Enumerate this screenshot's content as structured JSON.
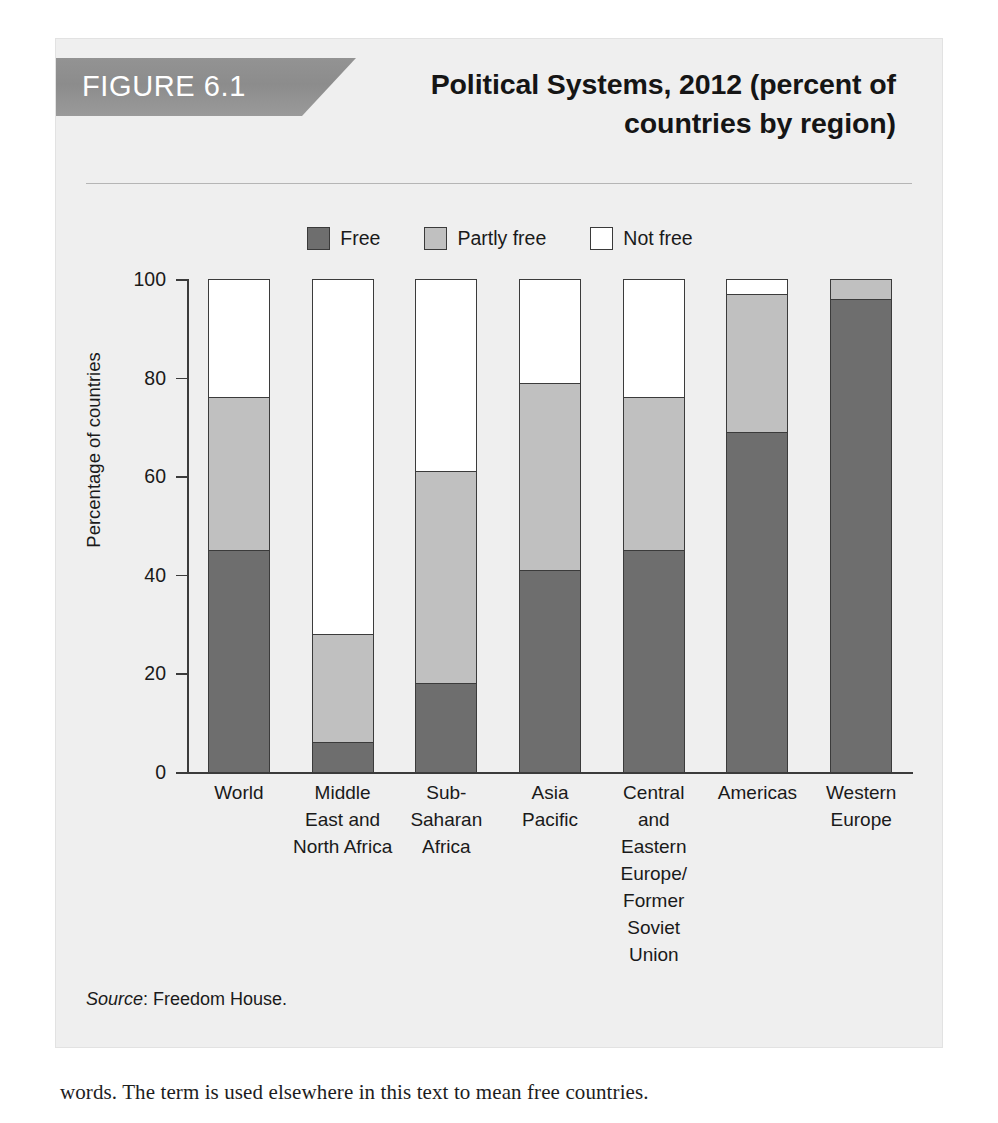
{
  "figure": {
    "number_label": "FIGURE 6.1",
    "title_line1": "Political Systems, 2012 (percent of",
    "title_line2": "countries by region)",
    "source_prefix": "Source",
    "source_text": ": Freedom House."
  },
  "colors": {
    "free": "#6e6e6e",
    "partly_free": "#c0c0c0",
    "not_free": "#ffffff",
    "outline": "#3b3b3b",
    "card_background": "#efefef",
    "tab_background": "#8f8f8f",
    "tab_text": "#ffffff",
    "text": "#1a1a1a"
  },
  "page": {
    "body_caption": "words. The term is used elsewhere in this text to mean free countries."
  },
  "chart_data": {
    "type": "bar",
    "stacked": true,
    "normalized_percent": true,
    "title": "Political Systems, 2012 (percent of countries by region)",
    "xlabel": "",
    "ylabel": "Percentage of countries",
    "ylim": [
      0,
      100
    ],
    "yticks": [
      0,
      20,
      40,
      60,
      80,
      100
    ],
    "ytick_labels": [
      "0",
      "20",
      "40",
      "60",
      "80",
      "100"
    ],
    "grid": false,
    "legend_position": "top-center",
    "categories": [
      "World",
      "Middle East and North Africa",
      "Sub-Saharan Africa",
      "Asia Pacific",
      "Central and Eastern Europe/ Former Soviet Union",
      "Americas",
      "Western Europe"
    ],
    "category_label_lines": [
      [
        "World"
      ],
      [
        "Middle",
        "East and",
        "North Africa"
      ],
      [
        "Sub-",
        "Saharan",
        "Africa"
      ],
      [
        "Asia",
        "Pacific"
      ],
      [
        "Central",
        "and",
        "Eastern",
        "Europe/",
        "Former",
        "Soviet Union"
      ],
      [
        "Americas"
      ],
      [
        "Western",
        "Europe"
      ]
    ],
    "series": [
      {
        "name": "Free",
        "color": "#6e6e6e",
        "values": [
          45,
          6,
          18,
          41,
          45,
          69,
          96
        ]
      },
      {
        "name": "Partly free",
        "color": "#c0c0c0",
        "values": [
          31,
          22,
          43,
          38,
          31,
          28,
          4
        ]
      },
      {
        "name": "Not free",
        "color": "#ffffff",
        "values": [
          24,
          72,
          39,
          21,
          24,
          3,
          0
        ]
      }
    ],
    "cumulative_tops": {
      "free": [
        45,
        6,
        18,
        41,
        45,
        69,
        96
      ],
      "free_plus_partly": [
        76,
        28,
        61,
        79,
        76,
        97,
        100
      ]
    },
    "legend": [
      {
        "label": "Free",
        "color": "#6e6e6e"
      },
      {
        "label": "Partly free",
        "color": "#c0c0c0"
      },
      {
        "label": "Not free",
        "color": "#ffffff"
      }
    ]
  }
}
